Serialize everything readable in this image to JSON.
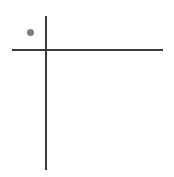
{
  "figure": {
    "title": "",
    "background_color": "#ffffff",
    "width": 174,
    "height": 177
  },
  "axes": {
    "line_color": "#3a3a3a",
    "line_width": 2,
    "vertical": {
      "name": "y-axis",
      "x": 46,
      "y_top": 16,
      "y_bottom": 170,
      "label": ""
    },
    "horizontal": {
      "name": "x-axis",
      "y": 50,
      "x_left": 12,
      "x_right": 163,
      "label": ""
    },
    "origin": {
      "x": 46,
      "y": 50
    }
  },
  "chart_data": {
    "type": "scatter",
    "title": "",
    "xlabel": "",
    "ylabel": "",
    "grid": false,
    "legend": null,
    "axis_style": "crossed-axes",
    "point_color": "#7d7d7d",
    "point_size": 7,
    "points": [
      {
        "label": "",
        "px_x": 30.5,
        "px_y": 32.5,
        "x": -0.15,
        "y": 0.17
      }
    ],
    "series": [
      {
        "name": "point",
        "color": "#7d7d7d",
        "x": [
          -0.15
        ],
        "y": [
          0.17
        ]
      }
    ],
    "xlim": [
      -0.34,
      1.17
    ],
    "ylim": [
      -1.2,
      0.34
    ],
    "tick_labels_x": [],
    "tick_labels_y": []
  }
}
